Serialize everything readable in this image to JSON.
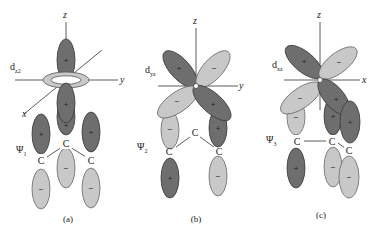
{
  "panels": [
    {
      "id": "a",
      "caption": "(a)",
      "orbital_label": "d",
      "orbital_sub": "z2",
      "axes": {
        "vertical": "z",
        "horizontal": "y",
        "diagonal": "x"
      },
      "mo_label": "Ψ",
      "mo_sub": "1",
      "atoms": [
        "C",
        "C",
        "C"
      ],
      "signs": {
        "upper_lobe": "+",
        "lower_lobe": "+",
        "ring": "",
        "p_left_top": "+",
        "p_left_bottom": "−",
        "p_mid_top": "+",
        "p_mid_bottom": "−",
        "p_right_top": "+",
        "p_right_bottom": "−"
      }
    },
    {
      "id": "b",
      "caption": "(b)",
      "orbital_label": "d",
      "orbital_sub": "yz",
      "axes": {
        "vertical": "z",
        "horizontal": "y"
      },
      "mo_label": "Ψ",
      "mo_sub": "2",
      "atoms": [
        "C",
        "C",
        "C"
      ],
      "signs": {
        "ul": "+",
        "ur": "−",
        "ll": "−",
        "lr": "+",
        "p_left_top": "−",
        "p_left_bottom": "+",
        "p_right_top": "+",
        "p_right_bottom": "−"
      }
    },
    {
      "id": "c",
      "caption": "(c)",
      "orbital_label": "d",
      "orbital_sub": "xz",
      "axes": {
        "vertical": "z",
        "horizontal": "x"
      },
      "mo_label": "Ψ",
      "mo_sub": "3",
      "atoms": [
        "C",
        "C",
        "C"
      ],
      "signs": {
        "ul": "+",
        "ur": "−",
        "ll": "−",
        "lr": "+",
        "p_left_top": "−",
        "p_left_bottom": "+",
        "p_mid_top": "+",
        "p_mid_bottom": "−",
        "p_right_top": "+",
        "p_right_bottom": "−"
      }
    }
  ]
}
